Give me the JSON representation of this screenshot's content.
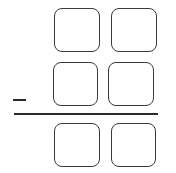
{
  "diagram": {
    "type": "vertical-subtraction",
    "operator": "−",
    "rows": [
      {
        "name": "minuend",
        "digits": [
          "",
          ""
        ]
      },
      {
        "name": "subtrahend",
        "digits": [
          "",
          ""
        ]
      },
      {
        "name": "difference",
        "digits": [
          "",
          ""
        ]
      }
    ],
    "colors": {
      "stroke": "#3a3a3a",
      "background": "#ffffff"
    }
  }
}
